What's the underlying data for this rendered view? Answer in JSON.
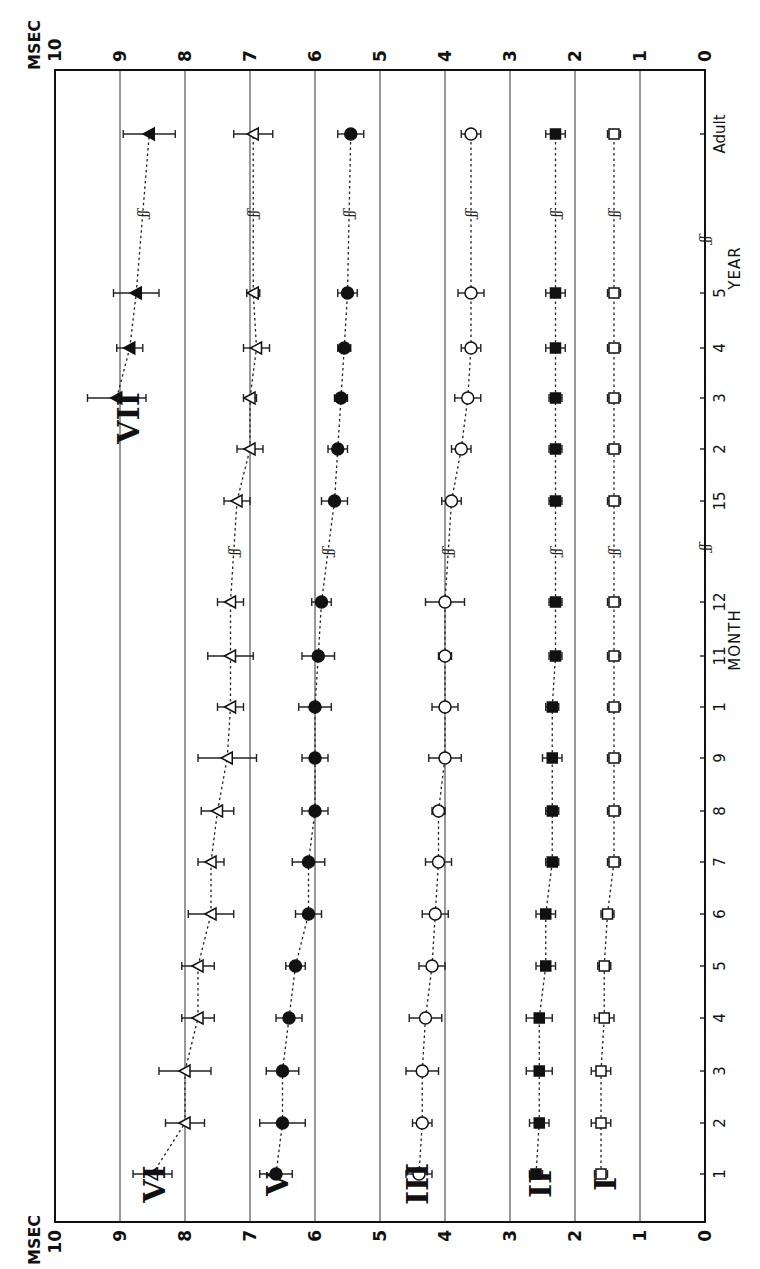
{
  "chart_data": {
    "type": "line",
    "title": "",
    "orientation": "rotated 90° clockwise (value axis runs horizontally across the page, age axis vertically)",
    "ylabel": "MSEC",
    "xlabel_month": "MONTH",
    "xlabel_year": "YEAR",
    "ylim": [
      0,
      10
    ],
    "yticks": [
      "0",
      "1",
      "2",
      "3",
      "4",
      "5",
      "6",
      "7",
      "8",
      "9",
      "10"
    ],
    "grid": true,
    "x": [
      "1",
      "2",
      "3",
      "4",
      "5",
      "6",
      "7",
      "8",
      "9",
      "10",
      "11",
      "12",
      "15",
      "2",
      "3",
      "4",
      "5",
      "Adult"
    ],
    "x_tick_labels_shown": [
      "1",
      "2",
      "3",
      "4",
      "5",
      "6",
      "7",
      "8",
      "9",
      "1",
      "11",
      "12",
      "15",
      "2",
      "3",
      "4",
      "5",
      "Adult"
    ],
    "x_units": [
      "month",
      "month",
      "month",
      "month",
      "month",
      "month",
      "month",
      "month",
      "month",
      "month",
      "month",
      "month",
      "month",
      "year",
      "year",
      "year",
      "year",
      "adult"
    ],
    "axis_breaks": [
      "between 12 and 15 months",
      "between 5 years and Adult"
    ],
    "series": [
      {
        "name": "I",
        "marker": "open-square",
        "values": [
          1.6,
          1.6,
          1.6,
          1.55,
          1.55,
          1.5,
          1.4,
          1.4,
          1.4,
          1.4,
          1.4,
          1.4,
          1.4,
          1.4,
          1.4,
          1.4,
          1.4,
          1.4
        ],
        "err": [
          0.1,
          0.15,
          0.15,
          0.15,
          0.1,
          0.1,
          0.1,
          0.1,
          0.1,
          0.1,
          0.1,
          0.1,
          0.1,
          0.1,
          0.1,
          0.1,
          0.1,
          0.1
        ]
      },
      {
        "name": "II",
        "marker": "filled-square",
        "values": [
          2.6,
          2.55,
          2.55,
          2.55,
          2.45,
          2.45,
          2.35,
          2.35,
          2.35,
          2.35,
          2.3,
          2.3,
          2.3,
          2.3,
          2.3,
          2.3,
          2.3,
          2.3
        ],
        "err": [
          0.1,
          0.15,
          0.2,
          0.2,
          0.15,
          0.15,
          0.1,
          0.1,
          0.15,
          0.1,
          0.1,
          0.1,
          0.1,
          0.1,
          0.1,
          0.15,
          0.15,
          0.15
        ]
      },
      {
        "name": "III",
        "marker": "open-circle",
        "values": [
          4.4,
          4.35,
          4.35,
          4.3,
          4.2,
          4.15,
          4.1,
          4.1,
          4.0,
          4.0,
          4.0,
          4.0,
          3.9,
          3.75,
          3.65,
          3.6,
          3.6,
          3.6
        ],
        "err": [
          0.2,
          0.15,
          0.25,
          0.25,
          0.2,
          0.2,
          0.2,
          0.1,
          0.25,
          0.2,
          0.1,
          0.3,
          0.15,
          0.15,
          0.2,
          0.15,
          0.2,
          0.15
        ]
      },
      {
        "name": "V",
        "marker": "filled-circle",
        "values": [
          6.6,
          6.5,
          6.5,
          6.4,
          6.3,
          6.1,
          6.1,
          6.0,
          6.0,
          6.0,
          5.95,
          5.9,
          5.7,
          5.65,
          5.6,
          5.55,
          5.5,
          5.45
        ],
        "err": [
          0.25,
          0.35,
          0.25,
          0.2,
          0.15,
          0.2,
          0.25,
          0.2,
          0.2,
          0.25,
          0.25,
          0.15,
          0.2,
          0.15,
          0.1,
          0.1,
          0.15,
          0.2
        ]
      },
      {
        "name": "VI",
        "marker": "open-triangle",
        "values": [
          8.5,
          8.0,
          8.0,
          7.8,
          7.8,
          7.6,
          7.6,
          7.5,
          7.35,
          7.3,
          7.3,
          7.3,
          7.2,
          7.0,
          7.0,
          6.9,
          6.95,
          6.95
        ],
        "err": [
          0.3,
          0.3,
          0.4,
          0.25,
          0.25,
          0.35,
          0.2,
          0.25,
          0.45,
          0.2,
          0.35,
          0.2,
          0.2,
          0.2,
          0.1,
          0.2,
          0.1,
          0.3
        ]
      },
      {
        "name": "VII",
        "marker": "filled-triangle",
        "values": [
          null,
          null,
          null,
          null,
          null,
          null,
          null,
          null,
          null,
          null,
          null,
          null,
          null,
          null,
          9.05,
          8.85,
          8.75,
          8.55
        ],
        "err": [
          null,
          null,
          null,
          null,
          null,
          null,
          null,
          null,
          null,
          null,
          null,
          null,
          null,
          null,
          0.45,
          0.2,
          0.35,
          0.4
        ]
      }
    ],
    "annotations": [
      "VII",
      "VI",
      "V",
      "III",
      "II",
      "I"
    ]
  },
  "labels": {
    "msec_top": "MSEC",
    "msec_bottom": "MSEC",
    "month": "MONTH",
    "year": "YEAR",
    "break_mark": "ʃʃ"
  }
}
